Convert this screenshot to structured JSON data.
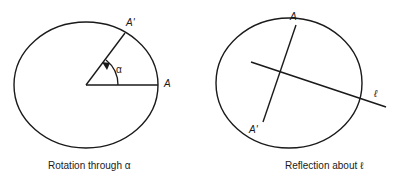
{
  "diagrams": [
    {
      "id": "rotation",
      "caption": "Rotation through α",
      "labels": {
        "point": "A",
        "image_point": "A'",
        "angle": "α"
      }
    },
    {
      "id": "reflection",
      "caption": "Reflection about ℓ",
      "labels": {
        "point": "A",
        "image_point": "A'",
        "line": "ℓ"
      }
    }
  ],
  "colors": {
    "stroke": "#1a1a1a",
    "background": "#ffffff"
  }
}
